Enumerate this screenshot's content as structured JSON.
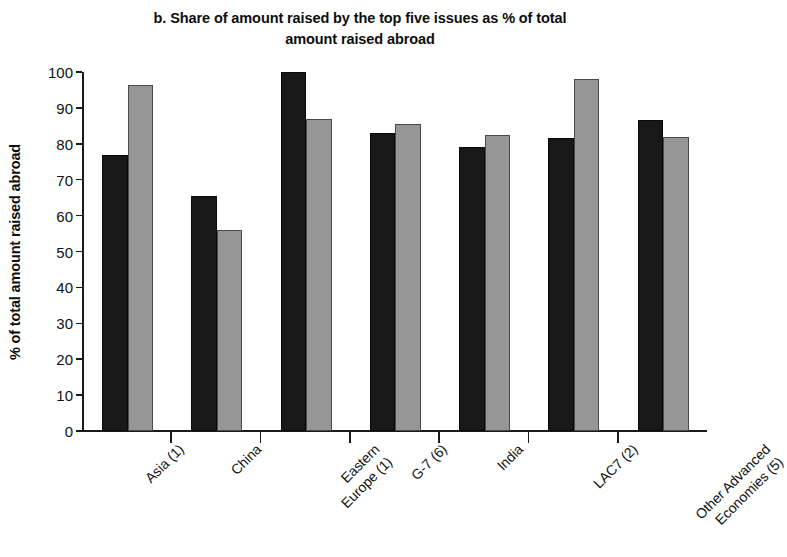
{
  "chart_data": {
    "type": "bar",
    "title": "b. Share of amount raised by the top five issues as % of total amount raised abroad",
    "title_line1": "b. Share of amount raised by the top five issues as % of total",
    "title_line2": "amount raised abroad",
    "xlabel": "",
    "ylabel": "% of total amount raised abroad",
    "ylim": [
      0,
      100
    ],
    "yticks": [
      0,
      10,
      20,
      30,
      40,
      50,
      60,
      70,
      80,
      90,
      100
    ],
    "ytick_labels": [
      "0",
      "10",
      "20",
      "30",
      "40",
      "50",
      "60",
      "70",
      "80",
      "90",
      "100"
    ],
    "grid": false,
    "legend": "none",
    "categories": [
      "Asia (1)",
      "China",
      "Eastern Europe (1)",
      "G-7 (6)",
      "India",
      "LAC7 (2)",
      "Other Advanced Economies (5)"
    ],
    "category_lines": [
      [
        "Asia (1)"
      ],
      [
        "China"
      ],
      [
        "Eastern",
        "Europe (1)"
      ],
      [
        "G-7 (6)"
      ],
      [
        "India"
      ],
      [
        "LAC7 (2)"
      ],
      [
        "Other Advanced",
        "Economies (5)"
      ]
    ],
    "series": [
      {
        "name": "series-1",
        "color": "#181818",
        "values": [
          77,
          65.5,
          100,
          83,
          79,
          81.5,
          86.5
        ]
      },
      {
        "name": "series-2",
        "color": "#969696",
        "values": [
          96.5,
          56,
          87,
          85.5,
          82.5,
          98,
          82
        ]
      }
    ]
  },
  "colors": {
    "series_1": "#181818",
    "series_2": "#969696",
    "axis": "#1a1a1a",
    "text": "#111111",
    "background": "#ffffff"
  }
}
